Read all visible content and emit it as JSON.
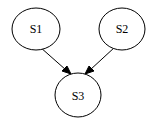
{
  "diagram": {
    "type": "directed-graph",
    "nodes": [
      {
        "id": "S1",
        "label": "S1",
        "shape": "ellipse"
      },
      {
        "id": "S2",
        "label": "S2",
        "shape": "ellipse"
      },
      {
        "id": "S3",
        "label": "S3",
        "shape": "ellipse"
      }
    ],
    "edges": [
      {
        "from": "S1",
        "to": "S3",
        "directed": true
      },
      {
        "from": "S2",
        "to": "S3",
        "directed": true
      }
    ],
    "colors": {
      "stroke": "#000000",
      "fill": "#ffffff",
      "text": "#000000"
    }
  }
}
